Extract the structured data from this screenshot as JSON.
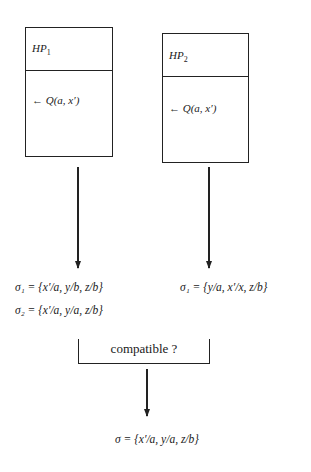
{
  "diagram": {
    "boxes": [
      {
        "id": "hp1",
        "title_base": "HP",
        "title_sub": "1",
        "goal": "← Q(a, x′)"
      },
      {
        "id": "hp2",
        "title_base": "HP",
        "title_sub": "2",
        "goal": "← Q(a, x′)"
      }
    ],
    "left_results": [
      "σ₁ = {x′/a, y/b, z/b}",
      "σ₂ = {x′/a, y/a, z/b}"
    ],
    "right_results": [
      "σ₁ = {y/a, x′/x, z/b}"
    ],
    "merge_label": "compatible ?",
    "final_result": "σ = {x′/a, y/a, z/b}",
    "colors": {
      "line": "#222222",
      "background": "#ffffff"
    }
  }
}
